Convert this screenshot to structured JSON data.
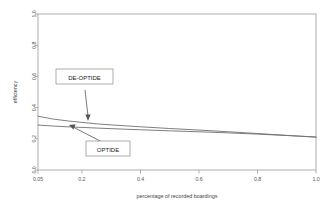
{
  "chart_data": {
    "type": "line",
    "title": "",
    "xlabel": "percentage of recorded boardings",
    "ylabel": "efficiency",
    "xlim": [
      0.05,
      1.0
    ],
    "ylim": [
      0.0,
      1.0
    ],
    "grid": false,
    "legend_position": "none",
    "xticks": [
      "0.05",
      "0.2",
      "0.4",
      "0.6",
      "0.8",
      "1.0"
    ],
    "xtick_values": [
      0.05,
      0.2,
      0.4,
      0.6,
      0.8,
      1.0
    ],
    "yticks": [
      "0.0",
      "0.2",
      "0.4",
      "0.6",
      "0.8",
      "1.0"
    ],
    "ytick_values": [
      0.0,
      0.2,
      0.4,
      0.6,
      0.8,
      1.0
    ],
    "x": [
      0.05,
      0.1,
      0.15,
      0.2,
      0.25,
      0.3,
      0.4,
      0.5,
      0.6,
      0.7,
      0.8,
      0.9,
      1.0
    ],
    "series": [
      {
        "name": "DE-OPTIDE",
        "values": [
          0.345,
          0.327,
          0.315,
          0.305,
          0.296,
          0.289,
          0.277,
          0.266,
          0.256,
          0.245,
          0.234,
          0.222,
          0.211
        ]
      },
      {
        "name": "OPTIDE",
        "values": [
          0.288,
          0.282,
          0.277,
          0.273,
          0.269,
          0.265,
          0.258,
          0.251,
          0.245,
          0.238,
          0.23,
          0.221,
          0.211
        ]
      }
    ],
    "annotations": [
      {
        "label": "DE-OPTIDE",
        "target_x": 0.23,
        "target_y": 0.3
      },
      {
        "label": "OPTIDE",
        "target_x": 0.14,
        "target_y": 0.275
      }
    ]
  },
  "axes": {
    "x_title": "percentage of recorded boardings",
    "y_title": "efficiency",
    "x_tick_labels": [
      "0.05",
      "0.2",
      "0.4",
      "0.6",
      "0.8",
      "1.0"
    ],
    "y_tick_labels": [
      "0.0",
      "0.2",
      "0.4",
      "0.6",
      "0.8",
      "1.0"
    ]
  },
  "annotations": {
    "de_optide_label": "DE-OPTIDE",
    "optide_label": "OPTIDE"
  },
  "colors": {
    "background": "#ffffff",
    "frame": "#9a9a9a",
    "line": "#6f6f6f",
    "text": "#333333",
    "leader": "#555555"
  }
}
